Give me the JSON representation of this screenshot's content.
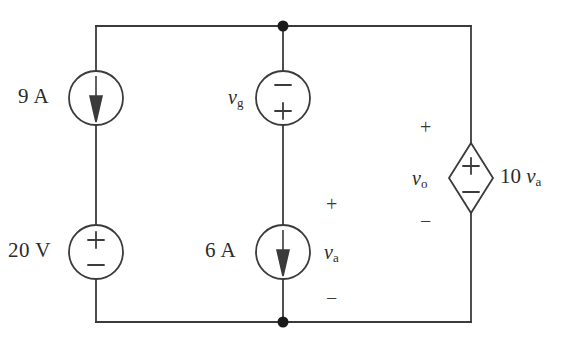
{
  "figure": {
    "type": "electrical-circuit-schematic",
    "background_color": "#ffffff",
    "line_color": "#3b3b3b",
    "text_color": "#2b2b2b"
  },
  "labels": {
    "current_source_9a": "9 A",
    "voltage_source_20v": "20 V",
    "voltage_source_vg": "v",
    "voltage_source_vg_sub": "g",
    "current_source_6a": "6 A",
    "voltage_va": "v",
    "voltage_va_sub": "a",
    "voltage_vo": "v",
    "voltage_vo_sub": "o",
    "dependent_source_value": "10 ",
    "dependent_source_var": "v",
    "dependent_source_var_sub": "a",
    "plus": "+",
    "minus": "−"
  },
  "elements": {
    "left_branch": {
      "top_source": {
        "name": "9 A",
        "kind": "independent-current-source",
        "arrow": "down"
      },
      "bottom_source": {
        "name": "20 V",
        "kind": "independent-voltage-source",
        "plus": "top",
        "minus": "bottom"
      }
    },
    "middle_branch": {
      "top_source": {
        "name": "vg",
        "kind": "independent-voltage-source",
        "plus": "bottom",
        "minus": "top"
      },
      "bottom_source": {
        "name": "6 A",
        "kind": "independent-current-source",
        "arrow": "down",
        "across_voltage": "va",
        "plus": "top",
        "minus": "bottom"
      }
    },
    "right_branch": {
      "source": {
        "name": "10 va",
        "kind": "dependent-voltage-source",
        "shape": "diamond",
        "plus": "top",
        "minus": "bottom",
        "across_voltage": "vo"
      }
    },
    "nodes": [
      {
        "name": "top-node",
        "x": 283,
        "y": 26
      },
      {
        "name": "bottom-node",
        "x": 283,
        "y": 322
      }
    ]
  }
}
